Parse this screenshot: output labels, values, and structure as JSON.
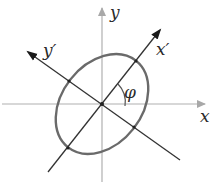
{
  "diagram": {
    "labels": {
      "x_axis": "x",
      "y_axis": "y",
      "x_prime_axis": "x′",
      "y_prime_axis": "y′",
      "angle": "φ"
    },
    "geometry": {
      "center": [
        102,
        104
      ],
      "ellipse_semi_major": 55,
      "ellipse_semi_minor": 40,
      "rotation_deg": 52
    },
    "colors": {
      "axes": "#b0b0b0",
      "rotated_axes": "#333333",
      "ellipse": "#6a6a6a",
      "background": "#ffffff"
    }
  }
}
